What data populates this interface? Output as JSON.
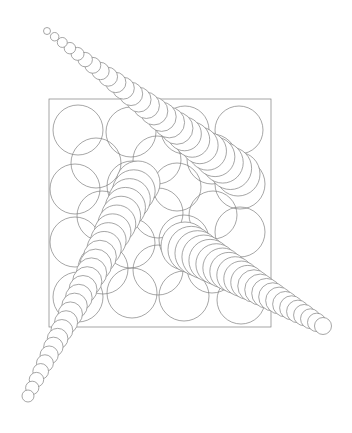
{
  "canvas": {
    "width": 352,
    "height": 433,
    "background": "#ffffff"
  },
  "style": {
    "stroke_color": "#7f7f7f",
    "stroke_width": 0.7,
    "grid_fill": "none",
    "trail_fill": "#ffffff"
  },
  "square": {
    "x": 49,
    "y": 99,
    "width": 222,
    "height": 228
  },
  "grid_circles": [
    [
      78,
      130,
      25
    ],
    [
      131,
      132,
      25
    ],
    [
      185,
      130,
      24
    ],
    [
      239,
      130,
      24
    ],
    [
      75,
      189,
      25
    ],
    [
      132,
      186,
      25
    ],
    [
      177,
      187,
      24
    ],
    [
      240,
      184,
      25
    ],
    [
      75,
      242,
      25
    ],
    [
      130,
      243,
      25
    ],
    [
      184,
      240,
      25
    ],
    [
      240,
      232,
      25
    ],
    [
      78,
      297,
      25
    ],
    [
      132,
      293,
      25
    ],
    [
      184,
      296,
      25
    ],
    [
      241,
      300,
      24
    ],
    [
      96,
      163,
      25
    ],
    [
      157,
      160,
      24
    ],
    [
      212,
      159,
      25
    ],
    [
      102,
      216,
      25
    ],
    [
      158,
      213,
      25
    ],
    [
      213,
      215,
      24
    ],
    [
      103,
      269,
      25
    ],
    [
      158,
      270,
      25
    ],
    [
      212,
      268,
      25
    ]
  ],
  "trails": [
    {
      "name": "trail-upper-diagonal",
      "start": {
        "x": 238,
        "y": 174,
        "r": 22
      },
      "end": {
        "x": 47,
        "y": 31,
        "r": 3.5
      },
      "count": 26
    },
    {
      "name": "trail-lower-left",
      "start": {
        "x": 138,
        "y": 183,
        "r": 22
      },
      "end": {
        "x": 28,
        "y": 396,
        "r": 6
      },
      "count": 27
    },
    {
      "name": "trail-lower-right",
      "start": {
        "x": 185,
        "y": 246,
        "r": 24
      },
      "end": {
        "x": 323,
        "y": 326,
        "r": 8.5
      },
      "count": 23
    }
  ]
}
